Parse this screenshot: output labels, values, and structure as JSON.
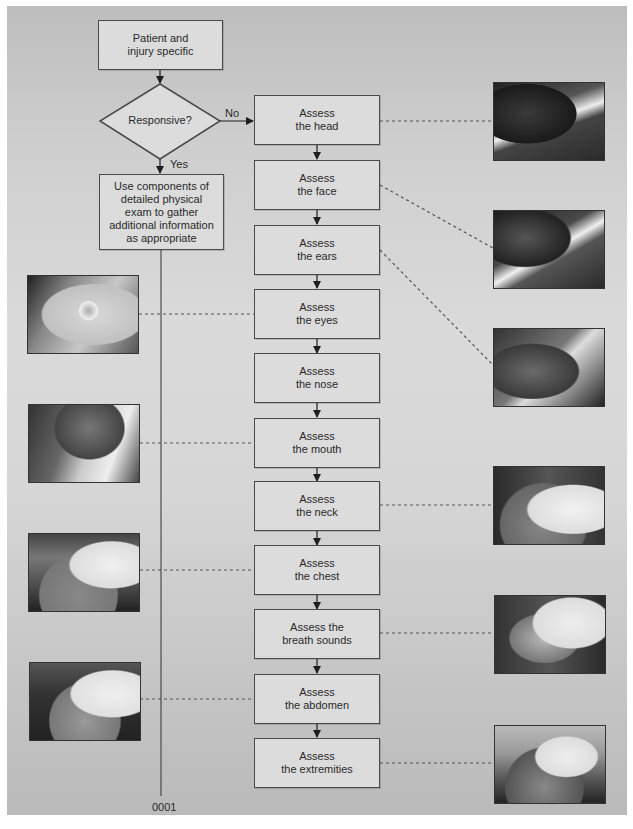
{
  "flowchart": {
    "start": {
      "label": "Patient and injury specific",
      "line1": "Patient and",
      "line2": "injury specific"
    },
    "decision": {
      "label": "Responsive?"
    },
    "branch_no": "No",
    "branch_yes": "Yes",
    "responsive_action": {
      "lines": [
        "Use components of",
        "detailed physical",
        "exam to gather",
        "additional information",
        "as appropriate"
      ]
    },
    "steps": [
      {
        "line1": "Assess",
        "line2": "the head",
        "photo_side": "right"
      },
      {
        "line1": "Assess",
        "line2": "the face",
        "photo_side": "right"
      },
      {
        "line1": "Assess",
        "line2": "the ears",
        "photo_side": "right"
      },
      {
        "line1": "Assess",
        "line2": "the eyes",
        "photo_side": "left"
      },
      {
        "line1": "Assess",
        "line2": "the nose",
        "photo_side": "none"
      },
      {
        "line1": "Assess",
        "line2": "the mouth",
        "photo_side": "left"
      },
      {
        "line1": "Assess",
        "line2": "the neck",
        "photo_side": "right"
      },
      {
        "line1": "Assess",
        "line2": "the chest",
        "photo_side": "left"
      },
      {
        "line1": "Assess the",
        "line2": "breath sounds",
        "photo_side": "right"
      },
      {
        "line1": "Assess",
        "line2": "the abdomen",
        "photo_side": "left"
      },
      {
        "line1": "Assess",
        "line2": "the extremities",
        "photo_side": "right"
      }
    ],
    "figure_code": "0001"
  },
  "photos": [
    {
      "name": "photo-head-assessment",
      "desc": "hands palpating head of patient on backboard"
    },
    {
      "name": "photo-face-assessment",
      "desc": "hands examining face with oxygen mask"
    },
    {
      "name": "photo-ears-assessment",
      "desc": "checking ears of immobilized patient"
    },
    {
      "name": "photo-eyes-assessment",
      "desc": "close-up of eye examination with oxygen mask"
    },
    {
      "name": "photo-mouth-assessment",
      "desc": "paramedic examining patient's mouth"
    },
    {
      "name": "photo-neck-assessment",
      "desc": "paramedic palpating patient's neck"
    },
    {
      "name": "photo-chest-assessment",
      "desc": "paramedic assessing chest in ambulance"
    },
    {
      "name": "photo-breath-sounds-assessment",
      "desc": "paramedic auscultating breath sounds"
    },
    {
      "name": "photo-abdomen-assessment",
      "desc": "paramedic palpating abdomen"
    },
    {
      "name": "photo-extremities-assessment",
      "desc": "paramedic assessing extremities"
    }
  ],
  "colors": {
    "box_fill": "#dcdcdc",
    "box_border": "#4a4a4a",
    "panel_gray": "#d0d0d0",
    "connector": "#555555"
  }
}
